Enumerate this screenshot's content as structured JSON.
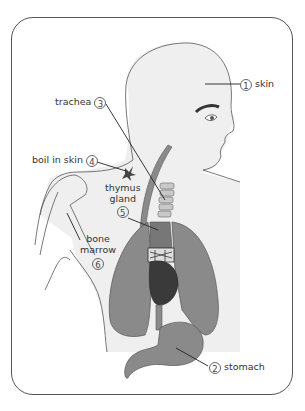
{
  "diagram": {
    "title": "",
    "labels": [
      {
        "id": "skin",
        "number": "1",
        "text": "skin"
      },
      {
        "id": "stomach",
        "number": "2",
        "text": "stomach"
      },
      {
        "id": "trachea",
        "number": "3",
        "text": "trachea"
      },
      {
        "id": "boil",
        "number": "4",
        "text": "boil in skin"
      },
      {
        "id": "thymus",
        "number": "5",
        "text_line1": "thymus",
        "text_line2": "gland"
      },
      {
        "id": "bone-marrow",
        "number": "6",
        "text_line1": "bone",
        "text_line2": "marrow"
      }
    ],
    "colors": {
      "frame": "#555555",
      "skin_fill": "#efefef",
      "outline": "#555555",
      "organ_gray": "#8a8a8a",
      "heart_dark": "#3a3a3a",
      "trachea_rings": "#c8c8c8"
    }
  }
}
